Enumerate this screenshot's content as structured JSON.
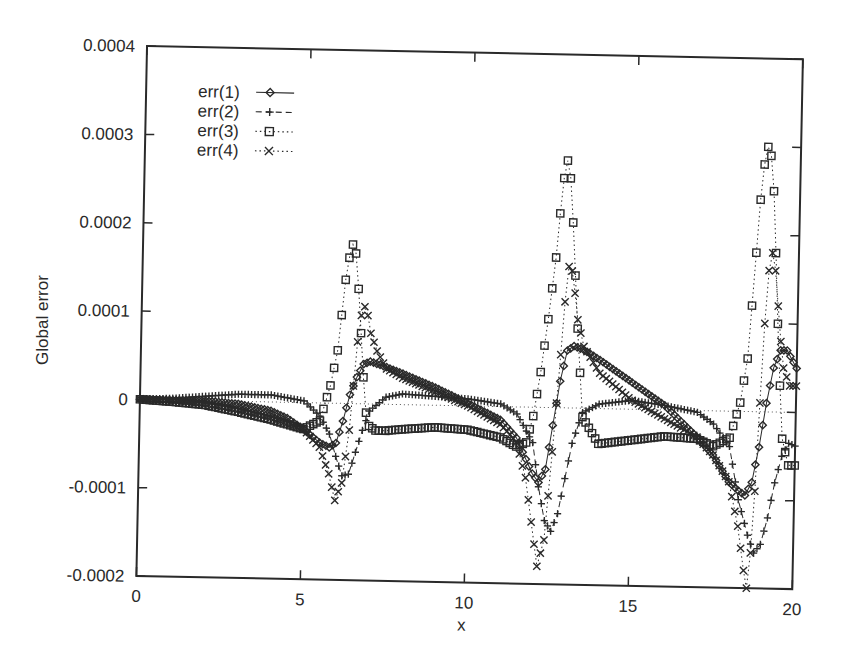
{
  "chart_data": {
    "type": "line",
    "title": "",
    "xlabel": "x",
    "ylabel": "Global error",
    "xlim": [
      0,
      20
    ],
    "ylim": [
      -0.0002,
      0.0004
    ],
    "x_ticks": [
      0,
      5,
      10,
      15,
      20
    ],
    "x_tick_labels": [
      "0",
      "5",
      "10",
      "15",
      "20"
    ],
    "y_ticks": [
      -0.0002,
      -0.0001,
      0,
      0.0001,
      0.0002,
      0.0003,
      0.0004
    ],
    "y_tick_labels": [
      "-0.0002",
      "-0.0001",
      "0",
      "0.0001",
      "0.0002",
      "0.0003",
      "0.0004"
    ],
    "grid": false,
    "legend_position": "upper left",
    "zero_line": true,
    "series": [
      {
        "name": "err(1)",
        "marker": "diamond",
        "line_style": "solid",
        "x": [
          0,
          1,
          2,
          3,
          4,
          4.5,
          5,
          5.5,
          5.8,
          6.0,
          6.2,
          6.4,
          6.6,
          6.8,
          7.0,
          7.5,
          8,
          9,
          10,
          11,
          11.5,
          12.0,
          12.2,
          12.4,
          12.6,
          12.8,
          13.0,
          13.2,
          13.5,
          14,
          15,
          16,
          17,
          17.5,
          18,
          18.3,
          18.5,
          18.7,
          18.9,
          19.1,
          19.3,
          19.5,
          19.7,
          20
        ],
        "y": [
          0,
          0,
          0,
          -3e-06,
          -1e-05,
          -1.8e-05,
          -3e-05,
          -4.5e-05,
          -5e-05,
          -4.5e-05,
          -2e-05,
          1e-05,
          3e-05,
          4.5e-05,
          4.8e-05,
          4.2e-05,
          3.5e-05,
          2e-05,
          3e-06,
          -1.5e-05,
          -3.5e-05,
          -7.5e-05,
          -8.5e-05,
          -7e-05,
          -2e-05,
          3e-05,
          6.5e-05,
          7e-05,
          6.6e-05,
          5.5e-05,
          3e-05,
          5e-06,
          -3e-05,
          -5e-05,
          -8e-05,
          -9e-05,
          -9.5e-05,
          -8e-05,
          -4e-05,
          1e-05,
          5e-05,
          7e-05,
          7e-05,
          5e-05
        ]
      },
      {
        "name": "err(2)",
        "marker": "plus",
        "line_style": "dashed",
        "x": [
          0,
          1,
          2,
          3,
          4,
          5,
          5.5,
          5.8,
          6.0,
          6.2,
          6.4,
          6.6,
          6.8,
          7.0,
          7.5,
          8,
          9,
          10,
          11,
          11.5,
          12.0,
          12.2,
          12.4,
          12.6,
          12.8,
          13.0,
          13.2,
          13.5,
          14,
          15,
          16,
          17,
          17.5,
          18,
          18.3,
          18.6,
          18.8,
          19.0,
          19.2,
          19.4,
          19.6,
          19.8,
          20
        ],
        "y": [
          0,
          2e-06,
          5e-06,
          8e-06,
          8e-06,
          2e-06,
          -1.5e-05,
          -3.5e-05,
          -6e-05,
          -8.2e-05,
          -8e-05,
          -5.5e-05,
          -3e-05,
          -8e-06,
          8e-06,
          1.2e-05,
          1e-05,
          8e-06,
          3e-06,
          -8e-06,
          -4e-05,
          -9e-05,
          -0.000128,
          -0.00014,
          -0.00012,
          -8e-05,
          -4e-05,
          -5e-06,
          5e-06,
          1e-05,
          5e-06,
          -2e-06,
          -1.5e-05,
          -4e-05,
          -0.0001,
          -0.00014,
          -0.00016,
          -0.00015,
          -0.00012,
          -8e-05,
          -5e-05,
          -3.5e-05,
          -3.8e-05
        ]
      },
      {
        "name": "err(3)",
        "marker": "square",
        "line_style": "dotted",
        "x": [
          0,
          1,
          2,
          3,
          4,
          5,
          5.5,
          5.8,
          6.0,
          6.1,
          6.2,
          6.3,
          6.4,
          6.5,
          6.6,
          6.7,
          6.8,
          6.9,
          7.0,
          7.2,
          7.5,
          8,
          9,
          10,
          11,
          11.5,
          11.8,
          12.0,
          12.2,
          12.4,
          12.6,
          12.7,
          12.8,
          12.9,
          13.0,
          13.1,
          13.2,
          13.3,
          13.5,
          14,
          15,
          16,
          17,
          17.5,
          18.0,
          18.3,
          18.5,
          18.6,
          18.7,
          18.8,
          18.9,
          19.0,
          19.1,
          19.2,
          19.3,
          19.4,
          19.5,
          19.6,
          19.8,
          20
        ],
        "y": [
          0,
          -2e-06,
          -5e-06,
          -1.2e-05,
          -2e-05,
          -3e-05,
          -2e-05,
          2e-05,
          6e-05,
          0.0001,
          0.00014,
          0.000165,
          0.00018,
          0.00017,
          0.00013,
          8e-05,
          3e-05,
          -1e-05,
          -2.5e-05,
          -3e-05,
          -3e-05,
          -2.8e-05,
          -2.5e-05,
          -2.7e-05,
          -3.5e-05,
          -4.5e-05,
          -4e-05,
          -1e-05,
          4e-05,
          0.0001,
          0.00017,
          0.00022,
          0.00026,
          0.00028,
          0.00026,
          0.00021,
          0.00015,
          9e-05,
          -1e-05,
          -4e-05,
          -3.5e-05,
          -3e-05,
          -3.2e-05,
          -4e-05,
          -3e-05,
          1e-05,
          6e-05,
          0.00012,
          0.00018,
          0.00024,
          0.00028,
          0.0003,
          0.00029,
          0.00025,
          0.00018,
          0.0001,
          3e-05,
          -3e-05,
          -6e-05,
          -6e-05
        ]
      },
      {
        "name": "err(4)",
        "marker": "cross",
        "line_style": "dotted",
        "x": [
          0,
          1,
          2,
          3,
          4,
          5,
          5.5,
          5.8,
          6.0,
          6.2,
          6.4,
          6.5,
          6.6,
          6.7,
          6.8,
          6.9,
          7.0,
          7.2,
          7.5,
          8,
          9,
          10,
          11,
          11.5,
          11.8,
          12.0,
          12.2,
          12.4,
          12.6,
          12.8,
          12.9,
          13.0,
          13.1,
          13.2,
          13.3,
          13.5,
          14,
          15,
          16,
          17,
          17.5,
          18.0,
          18.3,
          18.5,
          18.6,
          18.7,
          18.8,
          18.9,
          19.0,
          19.1,
          19.2,
          19.3,
          19.4,
          19.5,
          19.6,
          19.8,
          20
        ],
        "y": [
          0,
          -1e-06,
          -4e-06,
          -1e-05,
          -1.8e-05,
          -3e-05,
          -5e-05,
          -8e-05,
          -0.00011,
          -9e-05,
          -3e-05,
          2e-05,
          7e-05,
          0.0001,
          0.00011,
          0.0001,
          8e-05,
          6e-05,
          4e-05,
          3e-05,
          1.5e-05,
          0.0,
          -2e-05,
          -4e-05,
          -8e-05,
          -0.00013,
          -0.00018,
          -0.00015,
          -5e-05,
          6e-05,
          0.00012,
          0.00016,
          0.000155,
          0.00013,
          0.0001,
          7e-05,
          4e-05,
          1e-05,
          -1e-05,
          -3e-05,
          -5e-05,
          -8e-05,
          -0.00013,
          -0.00018,
          -0.0002,
          -0.00016,
          -9e-05,
          1e-05,
          0.0001,
          0.00016,
          0.00018,
          0.00016,
          0.00012,
          8e-05,
          5e-05,
          3e-05,
          3e-05
        ]
      }
    ]
  },
  "legend": {
    "items": [
      {
        "label": "err(1)",
        "marker": "diamond",
        "line_style": "solid"
      },
      {
        "label": "err(2)",
        "marker": "plus",
        "line_style": "dashed"
      },
      {
        "label": "err(3)",
        "marker": "square",
        "line_style": "dotted"
      },
      {
        "label": "err(4)",
        "marker": "cross",
        "line_style": "dotted"
      }
    ]
  },
  "colors": {
    "ink": "#2a2a2a",
    "background": "#ffffff"
  }
}
